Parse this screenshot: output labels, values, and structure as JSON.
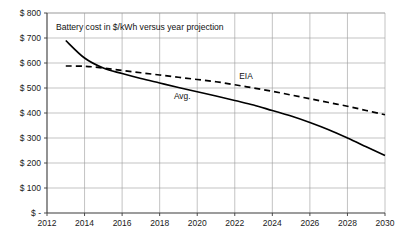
{
  "chart_data": {
    "type": "line",
    "title": "Battery cost in $/kWh versus year projection",
    "xlabel": "",
    "ylabel": "",
    "grid": true,
    "legend_position": "inline-annotations",
    "xlim": [
      2012,
      2030
    ],
    "ylim": [
      0,
      800
    ],
    "x_ticks": [
      2012,
      2014,
      2016,
      2018,
      2020,
      2022,
      2024,
      2026,
      2028,
      2030
    ],
    "x_tick_labels": [
      "2012",
      "2014",
      "2016",
      "2018",
      "2020",
      "2022",
      "2024",
      "2026",
      "2028",
      "2030"
    ],
    "y_ticks": [
      0,
      100,
      200,
      300,
      400,
      500,
      600,
      700,
      800
    ],
    "y_tick_labels": [
      "$ -",
      "$ 100",
      "$ 200",
      "$ 300",
      "$ 400",
      "$ 500",
      "$ 600",
      "$ 700",
      "$ 800"
    ],
    "x": [
      2013,
      2014,
      2015,
      2016,
      2017,
      2018,
      2019,
      2020,
      2021,
      2022,
      2023,
      2024,
      2025,
      2026,
      2027,
      2028,
      2029,
      2030
    ],
    "series": [
      {
        "name": "Avg.",
        "style": "solid",
        "color": "#000000",
        "label_x": 2019.2,
        "label_y": 455,
        "values": [
          690,
          620,
          580,
          558,
          538,
          520,
          502,
          485,
          468,
          450,
          432,
          410,
          388,
          362,
          333,
          300,
          265,
          230
        ]
      },
      {
        "name": "EIA",
        "style": "dashed",
        "color": "#000000",
        "label_x": 2022.6,
        "label_y": 537,
        "values": [
          588,
          587,
          580,
          570,
          561,
          552,
          543,
          534,
          525,
          513,
          500,
          487,
          472,
          457,
          442,
          427,
          410,
          393
        ]
      }
    ]
  }
}
